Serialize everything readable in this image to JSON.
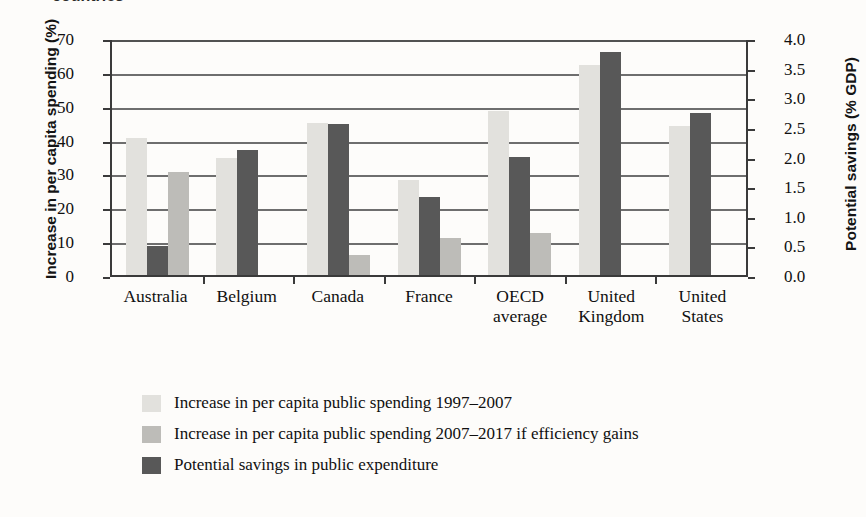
{
  "figure": {
    "clipped_title_top": "countries",
    "left_axis_title": "Increase in per capita spending (%)",
    "right_axis_title": "Potential savings (% GDP)"
  },
  "chart_data": {
    "type": "bar",
    "title": "",
    "xlabel": "",
    "ylabel": "Increase in per capita spending (%)",
    "y2label": "Potential savings (% GDP)",
    "ylim": [
      0,
      70
    ],
    "y2lim": [
      0.0,
      4.0
    ],
    "yticks": [
      0,
      10,
      20,
      30,
      40,
      50,
      60,
      70
    ],
    "y2ticks": [
      "0.0",
      "0.5",
      "1.0",
      "1.5",
      "2.0",
      "2.5",
      "3.0",
      "3.5",
      "4.0"
    ],
    "grid": true,
    "legend_position": "below",
    "categories": [
      "Australia",
      "Belgium",
      "Canada",
      "France",
      "OECD\naverage",
      "United\nKingdom",
      "United\nStates"
    ],
    "category_lines": [
      [
        "Australia"
      ],
      [
        "Belgium"
      ],
      [
        "Canada"
      ],
      [
        "France"
      ],
      [
        "OECD",
        "average"
      ],
      [
        "United",
        "Kingdom"
      ],
      [
        "United",
        "States"
      ]
    ],
    "series": [
      {
        "name": "Increase in per capita public spending 1997–2007",
        "color": "#e2e1dd",
        "axis": "left",
        "values": [
          40.5,
          34.5,
          45.0,
          28.0,
          48.5,
          62.0,
          44.0
        ]
      },
      {
        "name": "Increase in per capita public spending 2007–2017 if efficiency gains",
        "color": "#bdbcb8",
        "axis": "left",
        "values": [
          30.5,
          0,
          6.0,
          11.0,
          12.5,
          0,
          0
        ]
      },
      {
        "name": "Potential savings in public expenditure",
        "color": "#585858",
        "axis": "right",
        "values_percent_gdp": [
          0.5,
          2.1,
          2.55,
          1.3,
          2.0,
          3.75,
          2.75
        ],
        "values_left_scale": [
          8.5,
          37.0,
          44.5,
          23.0,
          35.0,
          66.0,
          48.0
        ]
      }
    ]
  },
  "legend": {
    "entries": [
      {
        "swatch": "s0",
        "label": "Increase in per capita public spending 1997–2007"
      },
      {
        "swatch": "s1",
        "label": "Increase in per capita public spending 2007–2017 if efficiency gains"
      },
      {
        "swatch": "s2",
        "label": "Potential savings in public expenditure"
      }
    ]
  },
  "colors": {
    "series_1997_2007": "#e2e1dd",
    "series_2007_2017": "#bdbcb8",
    "series_savings": "#585858",
    "axis": "#3a3a3a",
    "gridline": "#5a5a5a",
    "paper": "#fdfcfa"
  }
}
